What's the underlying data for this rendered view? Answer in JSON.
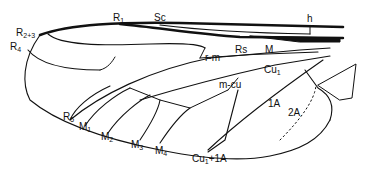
{
  "figure": {
    "type": "insect wing venation diagram",
    "stroke_color": "#111111",
    "background": "#ffffff"
  },
  "labels": {
    "r1": {
      "main": "R",
      "sub": "1"
    },
    "sc": {
      "main": "Sc",
      "sub": ""
    },
    "h": {
      "main": "h",
      "sub": ""
    },
    "r23": {
      "main": "R",
      "sub": "2+3"
    },
    "r4": {
      "main": "R",
      "sub": "4"
    },
    "rs": {
      "main": "Rs",
      "sub": ""
    },
    "m": {
      "main": "M",
      "sub": ""
    },
    "rm": {
      "main": "r-m",
      "sub": ""
    },
    "cu1": {
      "main": "Cu",
      "sub": "1"
    },
    "mcu": {
      "main": "m-cu",
      "sub": ""
    },
    "a1": {
      "main": "1A",
      "sub": ""
    },
    "a2": {
      "main": "2A",
      "sub": ""
    },
    "r5": {
      "main": "R",
      "sub": "5"
    },
    "m1": {
      "main": "M",
      "sub": "1"
    },
    "m2": {
      "main": "M",
      "sub": "2"
    },
    "m3": {
      "main": "M",
      "sub": "3"
    },
    "m4": {
      "main": "M",
      "sub": "4"
    },
    "cu1a": {
      "main": "Cu",
      "sub": "1",
      "tail": "+1A"
    }
  }
}
